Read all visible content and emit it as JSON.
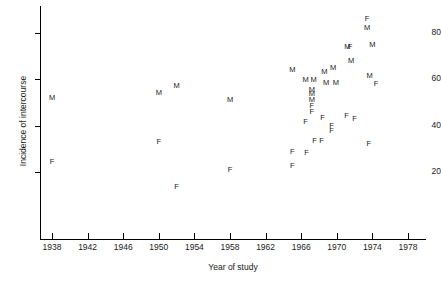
{
  "chart_data": {
    "type": "scatter",
    "title": "",
    "xlabel": "Year of study",
    "ylabel": "Incidence of intercourse",
    "xlim": [
      1936,
      1980
    ],
    "ylim": [
      0,
      90
    ],
    "xticks": [
      1938,
      1942,
      1946,
      1950,
      1954,
      1958,
      1962,
      1966,
      1970,
      1974,
      1978
    ],
    "yticks": [
      20,
      40,
      60,
      80
    ],
    "grid": false,
    "legend": null,
    "marker_style": "letter-glyph",
    "series": [
      {
        "name": "M",
        "label": "M",
        "points": [
          {
            "x": 1938.0,
            "y": 52.0
          },
          {
            "x": 1950.0,
            "y": 54.0
          },
          {
            "x": 1952.0,
            "y": 57.0
          },
          {
            "x": 1958.0,
            "y": 51.0
          },
          {
            "x": 1965.0,
            "y": 64.0
          },
          {
            "x": 1966.5,
            "y": 59.5
          },
          {
            "x": 1967.4,
            "y": 59.5
          },
          {
            "x": 1968.6,
            "y": 63.0
          },
          {
            "x": 1969.6,
            "y": 65.0
          },
          {
            "x": 1968.8,
            "y": 58.5
          },
          {
            "x": 1969.9,
            "y": 58.5
          },
          {
            "x": 1967.2,
            "y": 55.5
          },
          {
            "x": 1967.2,
            "y": 53.5
          },
          {
            "x": 1967.2,
            "y": 51.0
          },
          {
            "x": 1971.6,
            "y": 68.0
          },
          {
            "x": 1971.2,
            "y": 74.0
          },
          {
            "x": 1973.4,
            "y": 82.0
          },
          {
            "x": 1974.0,
            "y": 75.0
          },
          {
            "x": 1973.7,
            "y": 61.5
          }
        ]
      },
      {
        "name": "F",
        "label": "F",
        "points": [
          {
            "x": 1938.0,
            "y": 24.5
          },
          {
            "x": 1950.0,
            "y": 33.0
          },
          {
            "x": 1952.0,
            "y": 13.5
          },
          {
            "x": 1958.0,
            "y": 21.0
          },
          {
            "x": 1965.0,
            "y": 28.5
          },
          {
            "x": 1965.0,
            "y": 22.5
          },
          {
            "x": 1966.6,
            "y": 28.0
          },
          {
            "x": 1967.2,
            "y": 48.5
          },
          {
            "x": 1967.2,
            "y": 46.0
          },
          {
            "x": 1966.5,
            "y": 41.5
          },
          {
            "x": 1968.4,
            "y": 43.5
          },
          {
            "x": 1967.5,
            "y": 33.5
          },
          {
            "x": 1968.3,
            "y": 33.5
          },
          {
            "x": 1969.4,
            "y": 40.0
          },
          {
            "x": 1969.4,
            "y": 37.5
          },
          {
            "x": 1971.1,
            "y": 44.0
          },
          {
            "x": 1972.0,
            "y": 43.0
          },
          {
            "x": 1971.5,
            "y": 74.0
          },
          {
            "x": 1973.4,
            "y": 86.0
          },
          {
            "x": 1973.6,
            "y": 32.0
          },
          {
            "x": 1974.4,
            "y": 58.0
          }
        ]
      }
    ]
  },
  "axes": {
    "y_title": "Incidence of intercourse",
    "x_title": "Year of study",
    "y_tick_labels": [
      "80",
      "60",
      "40",
      "20"
    ],
    "x_tick_labels": [
      "1938",
      "1942",
      "1946",
      "1950",
      "1954",
      "1958",
      "1962",
      "1966",
      "1970",
      "1974",
      "1978"
    ]
  },
  "colors": {
    "axis": "#000000",
    "text": "#1a1a1a",
    "background": "#ffffff"
  }
}
